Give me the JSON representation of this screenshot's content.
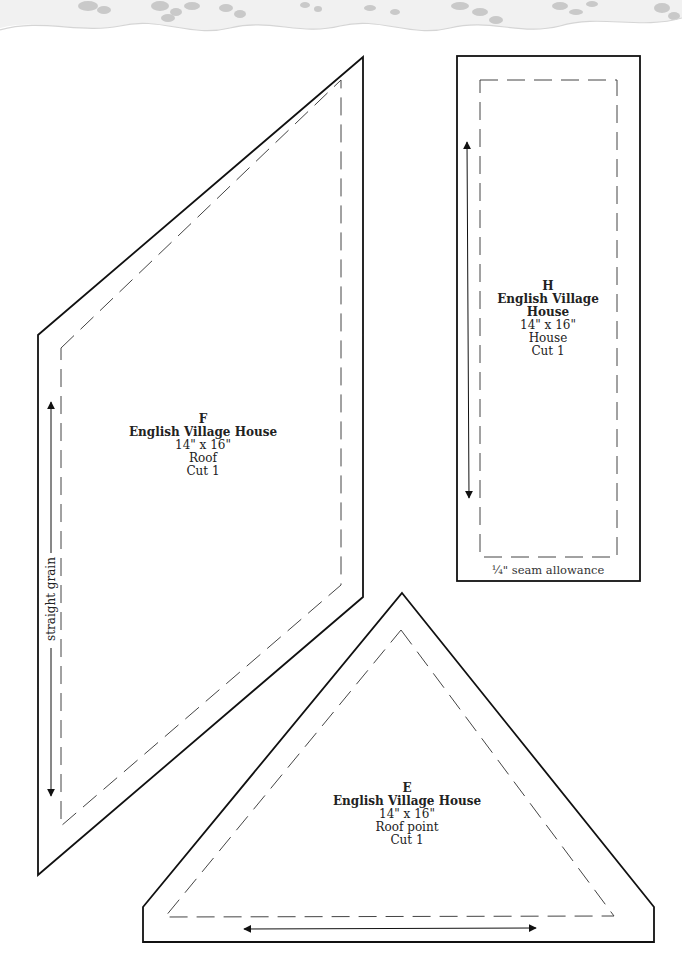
{
  "page": {
    "decorative_border": "lace-border-top",
    "colors": {
      "outline": "#111111",
      "dashed": "#444444",
      "lace": "#c8c8c8",
      "background": "#ffffff"
    }
  },
  "pieces": [
    {
      "id": "F",
      "letter": "F",
      "title": "English Village House",
      "size": "14\" x 16\"",
      "part": "Roof",
      "cut": "Cut 1",
      "shape": "parallelogram",
      "grain_label": "straight grain"
    },
    {
      "id": "H",
      "letter": "H",
      "title": "English Village House",
      "size": "14\" x 16\"",
      "part": "House",
      "cut": "Cut 1",
      "shape": "rectangle",
      "seam_note": "¼\" seam allowance"
    },
    {
      "id": "E",
      "letter": "E",
      "title": "English Village House",
      "size": "14\" x 16\"",
      "part": "Roof point",
      "cut": "Cut 1",
      "shape": "truncated-triangle"
    }
  ]
}
